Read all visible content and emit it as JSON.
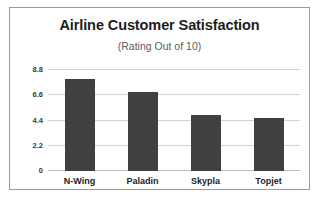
{
  "chart_data": {
    "type": "bar",
    "title": "Airline Customer Satisfaction",
    "subtitle": "(Rating Out of 10)",
    "categories": [
      "N-Wing",
      "Paladin",
      "Skypla",
      "Topjet"
    ],
    "values": [
      8.0,
      6.9,
      4.9,
      4.6
    ],
    "series": [
      {
        "name": "Rating",
        "values": [
          8.0,
          6.9,
          4.9,
          4.6
        ]
      }
    ],
    "xlabel": "",
    "ylabel": "",
    "ylim": [
      0,
      8.8
    ],
    "yticks": [
      "0",
      "2.2",
      "4.4",
      "6.6",
      "8.8"
    ],
    "ytick_values": [
      0,
      2.2,
      4.4,
      6.6,
      8.8
    ],
    "grid": true,
    "legend": false,
    "bar_color": "#404040",
    "grid_color": "#d2d2d2",
    "title_color": "#1d1d1d",
    "subtitle_color": "#5d5d5d",
    "border_color": "#9a9a9a",
    "background_color": "#ffffff"
  }
}
